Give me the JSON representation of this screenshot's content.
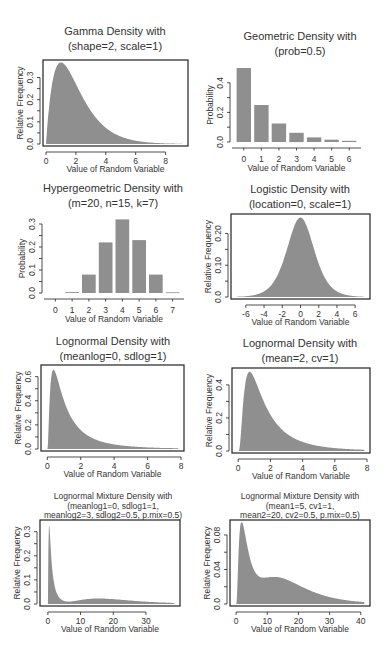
{
  "chart_data": [
    {
      "type": "area",
      "title": "Gamma Density with",
      "subtitle": "(shape=2, scale=1)",
      "xlabel": "Value of Random Variable",
      "ylabel": "Relative Frequency",
      "xlim": [
        0,
        9.3
      ],
      "ylim": [
        0,
        0.37
      ],
      "xticks": [
        0,
        2,
        4,
        6,
        8
      ],
      "yticks": [
        0.0,
        0.1,
        0.2,
        0.3
      ],
      "ytick_labels": [
        "0.0",
        "0.1",
        "0.2",
        "0.3"
      ],
      "box": true,
      "dist": "gamma",
      "params": {
        "shape": 2,
        "scale": 1
      },
      "frame": {
        "x0": 43,
        "x1": 188,
        "y0": 60,
        "y1": 146
      },
      "title_y": [
        35,
        50
      ],
      "cx": 115
    },
    {
      "type": "bar",
      "title": "Geometric Density with",
      "subtitle": "(prob=0.5)",
      "xlabel": "Value of Random Variable",
      "ylabel": "Probability",
      "categories": [
        "0",
        "1",
        "2",
        "3",
        "4",
        "5",
        "6"
      ],
      "values": [
        0.5,
        0.25,
        0.125,
        0.0625,
        0.03125,
        0.015625,
        0.0078
      ],
      "ylim": [
        0,
        0.5
      ],
      "yticks": [
        0.0,
        0.2,
        0.4
      ],
      "ytick_labels": [
        "0.0",
        "0.2",
        "0.4"
      ],
      "box": false,
      "frame": {
        "x0": 235,
        "x1": 358,
        "y0": 66,
        "y1": 144
      },
      "title_y": [
        40,
        55
      ],
      "cx": 300
    },
    {
      "type": "bar",
      "title": "Hypergeometric Density with",
      "subtitle": "(m=20, n=15, k=7)",
      "xlabel": "Value of Random Variable",
      "ylabel": "Probability",
      "categories": [
        "0",
        "1",
        "2",
        "3",
        "4",
        "5",
        "6",
        "7"
      ],
      "values": [
        0.0,
        0.004,
        0.08,
        0.22,
        0.32,
        0.23,
        0.08,
        0.003
      ],
      "ylim": [
        0,
        0.3
      ],
      "yticks": [
        0.0,
        0.1,
        0.2,
        0.3
      ],
      "ytick_labels": [
        "0.0",
        "0.1",
        "0.2",
        "0.3"
      ],
      "box": false,
      "frame": {
        "x0": 47,
        "x1": 181,
        "y0": 222,
        "y1": 295
      },
      "title_y": [
        192,
        207
      ],
      "cx": 113
    },
    {
      "type": "area",
      "title": "Logistic Density with",
      "subtitle": "(location=0, scale=1)",
      "xlabel": "Value of Random Variable",
      "ylabel": "Relative Frequency",
      "xlim": [
        -7.3,
        7.3
      ],
      "ylim": [
        0,
        0.255
      ],
      "xticks": [
        -6,
        -4,
        -2,
        0,
        2,
        4,
        6
      ],
      "yticks": [
        0.0,
        0.1,
        0.2
      ],
      "ytick_labels": [
        "0.0",
        "0.10",
        "0.20"
      ],
      "box": true,
      "dist": "logistic",
      "params": {
        "location": 0,
        "scale": 1
      },
      "frame": {
        "x0": 231,
        "x1": 370,
        "y0": 214,
        "y1": 299
      },
      "title_y": [
        193,
        208
      ],
      "cx": 300
    },
    {
      "type": "area",
      "title": "Lognormal Density with",
      "subtitle": "(meanlog=0, sdlog=1)",
      "xlabel": "Value of Random Variable",
      "ylabel": "Relative Frequency",
      "xlim": [
        -0.2,
        8.0
      ],
      "ylim": [
        0,
        0.68
      ],
      "xticks": [
        0,
        2,
        4,
        6,
        8
      ],
      "yticks": [
        0.0,
        0.2,
        0.4,
        0.6
      ],
      "ytick_labels": [
        "0.0",
        "0.2",
        "0.4",
        "0.6"
      ],
      "box": true,
      "dist": "lnorm",
      "params": {
        "meanlog": 0,
        "sdlog": 1
      },
      "frame": {
        "x0": 41,
        "x1": 184,
        "y0": 365,
        "y1": 451
      },
      "title_y": [
        345,
        360
      ],
      "cx": 113
    },
    {
      "type": "area",
      "title": "Lognormal Density with",
      "subtitle": "(mean=2, cv=1)",
      "xlabel": "Value of Random Variable",
      "ylabel": "Relative Frequency",
      "xlim": [
        -0.2,
        8.0
      ],
      "ylim": [
        0,
        0.49
      ],
      "xticks": [
        0,
        2,
        4,
        6,
        8
      ],
      "yticks": [
        0.0,
        0.2,
        0.4
      ],
      "ytick_labels": [
        "0.0",
        "0.2",
        "0.4"
      ],
      "box": true,
      "dist": "lnormAlt",
      "params": {
        "mean": 2,
        "cv": 1
      },
      "frame": {
        "x0": 232,
        "x1": 370,
        "y0": 368,
        "y1": 453
      },
      "title_y": [
        347,
        362
      ],
      "cx": 300
    },
    {
      "type": "area",
      "title": "Lognormal Mixture Density with",
      "subtitle": "(meanlog1=0, sdlog1=1,",
      "subtitle2": "meanlog2=3, sdlog2=0.5, p.mix=0.5)",
      "xlabel": "Value of Random Variable",
      "ylabel": "Relative Frequency",
      "xlim": [
        -1.5,
        39.5
      ],
      "ylim": [
        0,
        0.34
      ],
      "xticks": [
        0,
        10,
        20,
        30
      ],
      "yticks": [
        0.0,
        0.1,
        0.2,
        0.3
      ],
      "ytick_labels": [
        "0.0",
        "0.1",
        "0.2",
        "0.3"
      ],
      "box": true,
      "dist": "lnormMix",
      "params": {
        "meanlog1": 0,
        "sdlog1": 1,
        "meanlog2": 3,
        "sdlog2": 0.5,
        "p.mix": 0.5
      },
      "frame": {
        "x0": 40,
        "x1": 180,
        "y0": 520,
        "y1": 606
      },
      "title_y": [
        499,
        509,
        518
      ],
      "cx": 113
    },
    {
      "type": "area",
      "title": "Lognormal Mixture Density with",
      "subtitle": "(mean1=5, cv1=1,",
      "subtitle2": "mean2=20, cv2=0.5, p.mix=0.5)",
      "xlabel": "Value of Random Variable",
      "ylabel": "Relative Frequency",
      "xlim": [
        -1,
        42
      ],
      "ylim": [
        0,
        0.095
      ],
      "xticks": [
        0,
        10,
        20,
        30,
        40
      ],
      "yticks": [
        0.0,
        0.04,
        0.08
      ],
      "ytick_labels": [
        "0.0",
        "0.04",
        "0.08"
      ],
      "box": true,
      "dist": "lnormMixAlt",
      "params": {
        "mean1": 5,
        "cv1": 1,
        "mean2": 20,
        "cv2": 0.5,
        "p.mix": 0.5
      },
      "frame": {
        "x0": 230,
        "x1": 370,
        "y0": 520,
        "y1": 606
      },
      "title_y": [
        499,
        509,
        518
      ],
      "cx": 300
    }
  ],
  "colors": {
    "fill": "#8f8f8f",
    "axis": "#222222",
    "text": "#333333"
  }
}
